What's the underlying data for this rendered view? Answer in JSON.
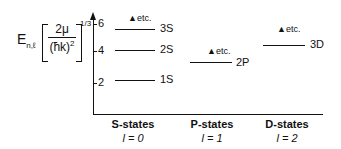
{
  "ylabel": {
    "E": "E",
    "sub": "n,ℓ",
    "num": "2μ",
    "den": "(ħk)",
    "densup": "2",
    "exp": "1/3"
  },
  "yticks": [
    "6",
    "4",
    "2"
  ],
  "levels": [
    {
      "label": "3S",
      "etc": "etc."
    },
    {
      "label": "2S"
    },
    {
      "label": "1S"
    },
    {
      "label": "2P",
      "etc": "etc."
    },
    {
      "label": "3D",
      "etc": "etc."
    }
  ],
  "categories": [
    {
      "name": "S-states",
      "l": "l = 0"
    },
    {
      "name": "P-states",
      "l": "l = 1"
    },
    {
      "name": "D-states",
      "l": "l = 2"
    }
  ]
}
